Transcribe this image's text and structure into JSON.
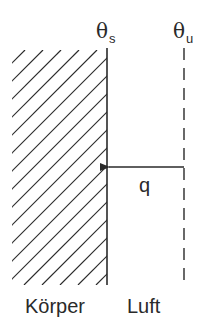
{
  "diagram": {
    "colors": {
      "line": "#2a2a2a",
      "background": "#ffffff"
    },
    "labels": {
      "surface_temperature": {
        "symbol": "θ",
        "subscript": "s"
      },
      "ambient_temperature": {
        "symbol": "θ",
        "subscript": "u"
      },
      "heat_flux": "q",
      "body": "Körper",
      "air": "Luft"
    },
    "geometry": {
      "body_region": {
        "x1": 12,
        "x2": 107,
        "y1": 50,
        "y2": 285,
        "hatch": "diagonal-45deg",
        "hatch_spacing": 18
      },
      "surface_line": {
        "x": 107,
        "y1": 48,
        "y2": 285,
        "style": "solid"
      },
      "ambient_line": {
        "x": 184,
        "y1": 48,
        "y2": 285,
        "style": "dashed",
        "dash": 12,
        "gap": 8
      },
      "heat_flux_arrow": {
        "from_x": 184,
        "to_x": 108,
        "y": 167,
        "direction": "left"
      }
    }
  }
}
